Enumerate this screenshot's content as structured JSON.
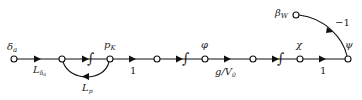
{
  "diagram": {
    "type": "signal-flow-graph",
    "nodes": [
      {
        "id": "n1",
        "label": "δa",
        "sub": "a",
        "main": "δ"
      },
      {
        "id": "n2",
        "label": ""
      },
      {
        "id": "n3",
        "label": "pK",
        "main": "p",
        "sub": "K"
      },
      {
        "id": "n4",
        "label": ""
      },
      {
        "id": "n5",
        "label": "φ",
        "main": "φ"
      },
      {
        "id": "n6",
        "label": ""
      },
      {
        "id": "n7",
        "label": "χ",
        "main": "χ"
      },
      {
        "id": "n8",
        "label": "ψ",
        "main": "ψ"
      },
      {
        "id": "n9",
        "label": "βW",
        "main": "β",
        "sub": "W"
      }
    ],
    "edges": [
      {
        "from": "n1",
        "to": "n2",
        "gain": "L_δa",
        "main": "L",
        "sub": "δa"
      },
      {
        "from": "n2",
        "to": "n3",
        "gain": "∫",
        "integrator": true
      },
      {
        "from": "n3",
        "to": "n2",
        "gain": "L_p",
        "main": "L",
        "sub": "p",
        "feedback": true
      },
      {
        "from": "n3",
        "to": "n4",
        "gain": "1"
      },
      {
        "from": "n4",
        "to": "n5",
        "gain": "∫",
        "integrator": true
      },
      {
        "from": "n5",
        "to": "n6",
        "gain": "g/V0",
        "main": "g/V",
        "sub": "0"
      },
      {
        "from": "n6",
        "to": "n7",
        "gain": "∫",
        "integrator": true
      },
      {
        "from": "n7",
        "to": "n8",
        "gain": "1"
      },
      {
        "from": "n9",
        "to": "n8",
        "gain": "−1"
      }
    ],
    "labels": {
      "delta_main": "δ",
      "delta_sub": "a",
      "pk_main": "p",
      "pk_sub": "K",
      "phi": "φ",
      "chi": "χ",
      "psi": "ψ",
      "beta_main": "β",
      "beta_sub": "W",
      "L_main": "L",
      "Ldelta_sub": "δ",
      "Ldelta_sub2": "a",
      "Lp_sub": "p",
      "gain1a": "1",
      "gain1b": "1",
      "gv_main": "g/V",
      "gv_sub": "0",
      "neg1": "−1",
      "integral": "∫"
    }
  }
}
